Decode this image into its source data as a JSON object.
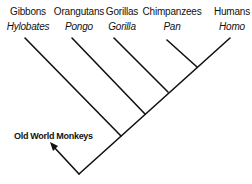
{
  "taxa": [
    {
      "common": "Gibbons",
      "genus": "Hylobates",
      "x": 28
    },
    {
      "common": "Orangutans",
      "genus": "Pongo",
      "x": 79
    },
    {
      "common": "Gorillas",
      "genus": "Gorilla",
      "x": 122
    },
    {
      "common": "Chimpanzees",
      "genus": "Pan",
      "x": 172
    },
    {
      "common": "Humans",
      "genus": "Homo",
      "x": 232
    }
  ],
  "outgroup": {
    "label": "Old World Monkeys"
  },
  "colors": {
    "line": "#111111",
    "text": "#111111",
    "background": "#ffffff"
  }
}
